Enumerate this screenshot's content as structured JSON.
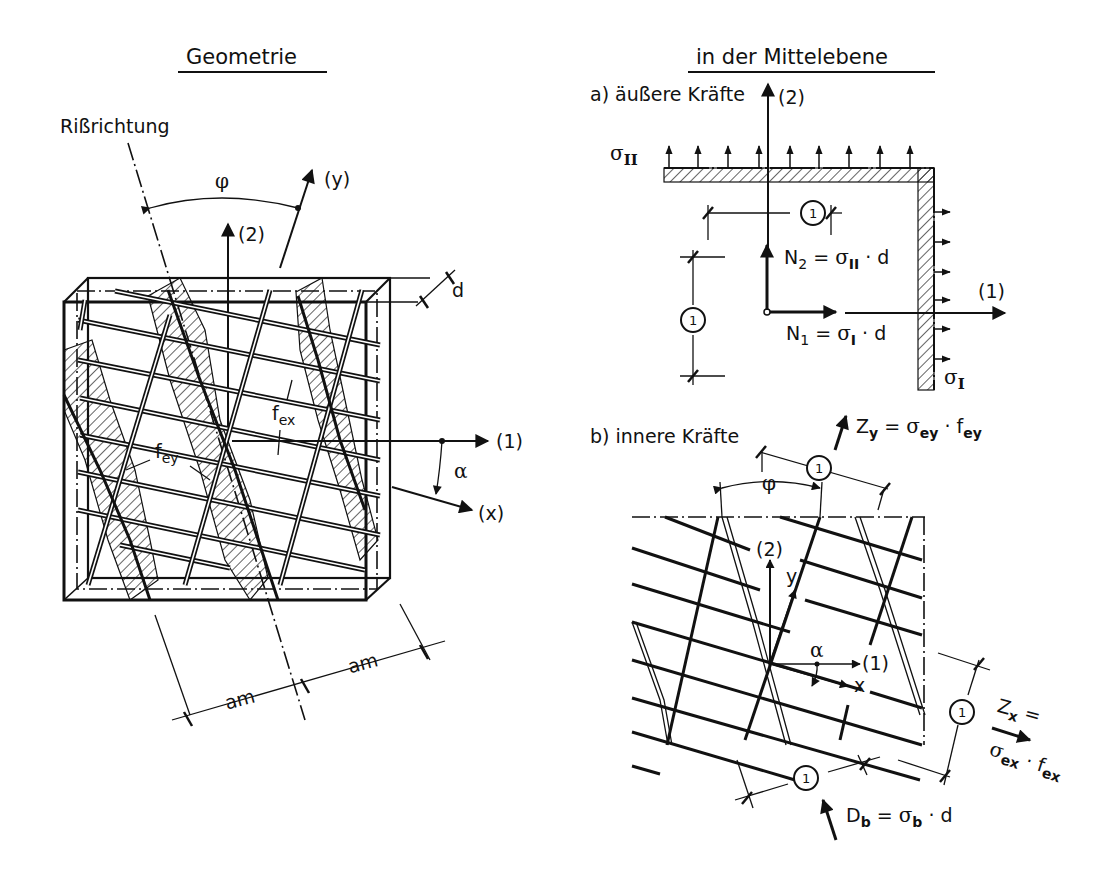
{
  "left_panel": {
    "title": "Geometrie",
    "crack_direction_label": "Rißrichtung",
    "angle_phi": "φ",
    "angle_alpha": "α",
    "axis_y": "(y)",
    "axis_x": "(x)",
    "axis_1": "(1)",
    "axis_2": "(2)",
    "thickness": "d",
    "rebar_x_label": "f",
    "rebar_x_sub": "ex",
    "rebar_y_label": "f",
    "rebar_y_sub": "ey",
    "spacing_left": "am",
    "spacing_right": "am"
  },
  "right_panel": {
    "title": "in der Mittelebene",
    "section_a": {
      "label": "a) äußere Kräfte",
      "axis_2": "(2)",
      "axis_1": "(1)",
      "stress_II": "σ",
      "stress_II_sub": "II",
      "stress_I": "σ",
      "stress_I_sub": "I",
      "unit_dim_top": "1",
      "unit_dim_left": "1",
      "N2_formula": {
        "lhs": "N",
        "lhs_sub": "2",
        "eq": " = ",
        "sigma": "σ",
        "sigma_sub": "II",
        "tail": " · d"
      },
      "N1_formula": {
        "lhs": "N",
        "lhs_sub": "1",
        "eq": " = ",
        "sigma": "σ",
        "sigma_sub": "I",
        "tail": " · d"
      }
    },
    "section_b": {
      "label": "b) innere Kräfte",
      "angle_phi": "φ",
      "angle_alpha": "α",
      "axis_2": "(2)",
      "axis_1": "(1)",
      "axis_x": "x",
      "axis_y": "y",
      "unit_dim_top": "1",
      "unit_dim_right": "1",
      "unit_dim_bottom": "1",
      "Zy_formula": {
        "lhs": "Z",
        "lhs_sub": "y",
        "eq": " = ",
        "sigma": "σ",
        "sigma_sub": "ey",
        "dot": " · ",
        "f": "f",
        "f_sub": "ey"
      },
      "Zx_formula": {
        "lhs": "Z",
        "lhs_sub": "x",
        "eq": " =",
        "sigma": "σ",
        "sigma_sub": "ex",
        "dot": " · ",
        "f": "f",
        "f_sub": "ex"
      },
      "Db_formula": {
        "lhs": "D",
        "lhs_sub": "b",
        "eq": " = ",
        "sigma": "σ",
        "sigma_sub": "b",
        "tail": " · d"
      }
    }
  }
}
